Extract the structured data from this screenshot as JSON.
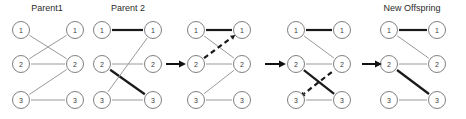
{
  "figure": {
    "title_visible": false,
    "background_color": "#ffffff",
    "width": 466,
    "height": 119,
    "colors": {
      "node_stroke": "#808080",
      "node_fill": "#ffffff",
      "edge_thin": "#9a9a9a",
      "edge_bold": "#1a1a1a",
      "edge_dashed": "#1a1a1a",
      "arrow": "#111111",
      "text": "#2b2b2b"
    },
    "node_labels": {
      "row1": "1",
      "row2": "2",
      "row3": "3"
    },
    "edge_styles": {
      "thin": "thin-solid-gray",
      "bold": "bold-solid-black",
      "dashed": "bold-dashed-black"
    }
  },
  "panels": [
    {
      "id": "parent1",
      "title": "Parent1",
      "title_x": 47,
      "title_y": 11,
      "left_x": 21,
      "right_x": 75,
      "left_labels": [
        "1",
        "2",
        "3"
      ],
      "right_labels": [
        "1",
        "2",
        "3"
      ],
      "edges": [
        {
          "from": 1,
          "to": 2,
          "style": "thin"
        },
        {
          "from": 2,
          "to": 1,
          "style": "thin"
        },
        {
          "from": 2,
          "to": 2,
          "style": "thin"
        },
        {
          "from": 3,
          "to": 2,
          "style": "thin"
        },
        {
          "from": 3,
          "to": 3,
          "style": "thin"
        }
      ]
    },
    {
      "id": "parent2",
      "title": "Parent 2",
      "title_x": 128,
      "title_y": 11,
      "left_x": 102,
      "right_x": 153,
      "left_labels": [
        "1",
        "2",
        "3"
      ],
      "right_labels": [
        "1",
        "2",
        "3"
      ],
      "edges": [
        {
          "from": 1,
          "to": 1,
          "style": "bold"
        },
        {
          "from": 2,
          "to": 2,
          "style": "thin"
        },
        {
          "from": 2,
          "to": 3,
          "style": "bold"
        },
        {
          "from": 3,
          "to": 1,
          "style": "thin"
        },
        {
          "from": 3,
          "to": 3,
          "style": "thin"
        }
      ]
    },
    {
      "id": "step1",
      "title": "",
      "title_x": 0,
      "title_y": 0,
      "left_x": 196,
      "right_x": 242,
      "left_labels": [
        "1",
        "2",
        "3"
      ],
      "right_labels": [
        "1",
        "2",
        "3"
      ],
      "edges": [
        {
          "from": 1,
          "to": 1,
          "style": "bold"
        },
        {
          "from": 1,
          "to": 2,
          "style": "thin"
        },
        {
          "from": 2,
          "to": 1,
          "style": "dashed",
          "arrow_at": "right"
        },
        {
          "from": 2,
          "to": 2,
          "style": "thin"
        },
        {
          "from": 3,
          "to": 2,
          "style": "thin"
        },
        {
          "from": 3,
          "to": 3,
          "style": "thin"
        }
      ]
    },
    {
      "id": "step2",
      "title": "",
      "title_x": 0,
      "title_y": 0,
      "left_x": 296,
      "right_x": 342,
      "left_labels": [
        "1",
        "2",
        "3"
      ],
      "right_labels": [
        "1",
        "2",
        "3"
      ],
      "edges": [
        {
          "from": 1,
          "to": 1,
          "style": "bold"
        },
        {
          "from": 1,
          "to": 2,
          "style": "thin"
        },
        {
          "from": 2,
          "to": 2,
          "style": "thin"
        },
        {
          "from": 2,
          "to": 3,
          "style": "bold"
        },
        {
          "from": 3,
          "to": 2,
          "style": "dashed",
          "arrow_at": "left"
        },
        {
          "from": 3,
          "to": 3,
          "style": "thin"
        }
      ]
    },
    {
      "id": "offspring",
      "title": "New Offspring",
      "title_x": 412,
      "title_y": 11,
      "left_x": 389,
      "right_x": 437,
      "left_labels": [
        "1",
        "2",
        "3"
      ],
      "right_labels": [
        "1",
        "2",
        "3"
      ],
      "edges": [
        {
          "from": 1,
          "to": 1,
          "style": "bold"
        },
        {
          "from": 1,
          "to": 2,
          "style": "thin"
        },
        {
          "from": 2,
          "to": 2,
          "style": "thin"
        },
        {
          "from": 2,
          "to": 3,
          "style": "bold"
        },
        {
          "from": 3,
          "to": 3,
          "style": "thin"
        }
      ]
    }
  ],
  "flow_arrows": [
    {
      "id": "arrow-1",
      "x1": 166,
      "x2": 183,
      "y": 64
    },
    {
      "id": "arrow-2",
      "x1": 265,
      "x2": 283,
      "y": 64
    },
    {
      "id": "arrow-3",
      "x1": 362,
      "x2": 379,
      "y": 64
    }
  ],
  "row_y": [
    30,
    64,
    100
  ],
  "node_radius": 8.5
}
